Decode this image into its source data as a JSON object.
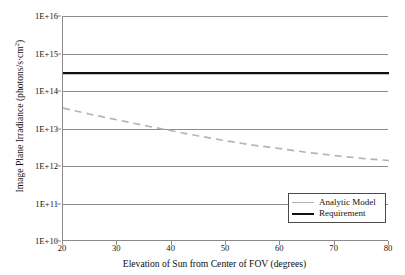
{
  "chart_data": {
    "type": "line",
    "title": "",
    "xlabel": "Elevation of Sun from Center of FOV (degrees)",
    "ylabel": "Image Plane Irradiance (photons/s·cm²)",
    "ylabel_base": "Image Plane Irradiance (photons/s·cm",
    "ylabel_sup": "2",
    "ylabel_tail": ")",
    "xlim": [
      20,
      80
    ],
    "ylim": [
      10000000000.0,
      1e+16
    ],
    "yscale": "log",
    "xscale": "linear",
    "grid": "horizontal",
    "legend_position": "lower-right-inside",
    "xticks": [
      20,
      30,
      40,
      50,
      60,
      70,
      80
    ],
    "xtick_labels": [
      "20",
      "30",
      "40",
      "50",
      "60",
      "70",
      "80"
    ],
    "yticks": [
      10000000000.0,
      100000000000.0,
      1000000000000.0,
      10000000000000.0,
      100000000000000.0,
      1000000000000000.0,
      1e+16
    ],
    "ytick_labels": [
      "1E+10",
      "1E+11",
      "1E+12",
      "1E+13",
      "1E+14",
      "1E+15",
      "1E+16"
    ],
    "series": [
      {
        "name": "Analytic Model",
        "style": "dashed",
        "color": "#b4b4b4",
        "x": [
          20,
          25,
          30,
          35,
          40,
          45,
          50,
          55,
          60,
          65,
          70,
          75,
          80
        ],
        "values": [
          35000000000000.0,
          24000000000000.0,
          17000000000000.0,
          12000000000000.0,
          8700000000000.0,
          6300000000000.0,
          4700000000000.0,
          3600000000000.0,
          2900000000000.0,
          2300000000000.0,
          1900000000000.0,
          1600000000000.0,
          1400000000000.0
        ]
      },
      {
        "name": "Requirement",
        "style": "solid",
        "color": "#111111",
        "x": [
          20,
          80
        ],
        "values": [
          300000000000000.0,
          300000000000000.0
        ]
      }
    ]
  },
  "legend": {
    "items": [
      {
        "label": "Analytic Model",
        "key": "analytic"
      },
      {
        "label": "Requirement",
        "key": "requirement"
      }
    ]
  },
  "colors": {
    "analytic": "#b4b4b4",
    "requirement": "#111111",
    "axis": "#8c8c8c",
    "grid": "#8c8c8c",
    "text": "#111111",
    "background": "#ffffff"
  }
}
